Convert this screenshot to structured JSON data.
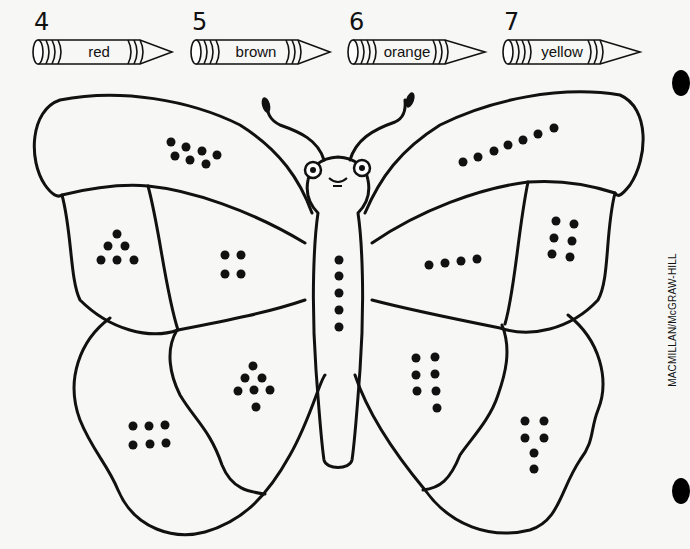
{
  "legend": {
    "crayons": [
      {
        "number": "4",
        "color_name": "red",
        "color": "#d62828"
      },
      {
        "number": "5",
        "color_name": "brown",
        "color": "#7a4a22"
      },
      {
        "number": "6",
        "color_name": "orange",
        "color": "#f28c1c"
      },
      {
        "number": "7",
        "color_name": "yellow",
        "color": "#f5d90a"
      }
    ]
  },
  "worksheet": {
    "type": "color-by-number",
    "subject": "butterfly",
    "regions": [
      {
        "id": "left-upper-wing-top",
        "dots": 7,
        "color_name": "yellow"
      },
      {
        "id": "right-upper-wing-top",
        "dots": 7,
        "color_name": "yellow"
      },
      {
        "id": "left-upper-wing-outer",
        "dots": 6,
        "color_name": "orange"
      },
      {
        "id": "right-upper-wing-outer",
        "dots": 6,
        "color_name": "orange"
      },
      {
        "id": "left-upper-wing-inner",
        "dots": 4,
        "color_name": "red"
      },
      {
        "id": "right-upper-wing-inner",
        "dots": 4,
        "color_name": "red"
      },
      {
        "id": "body",
        "dots": 5,
        "color_name": "brown"
      },
      {
        "id": "left-lower-wing-inner",
        "dots": 7,
        "color_name": "yellow"
      },
      {
        "id": "right-lower-wing-inner",
        "dots": 7,
        "color_name": "yellow"
      },
      {
        "id": "left-lower-wing-outer",
        "dots": 6,
        "color_name": "orange"
      },
      {
        "id": "right-lower-wing-outer",
        "dots": 6,
        "color_name": "orange"
      }
    ]
  },
  "footer": {
    "publisher": "MACMILLAN/McGRAW-HILL"
  }
}
